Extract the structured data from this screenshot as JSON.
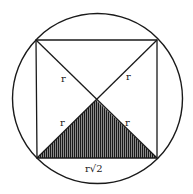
{
  "diagram": {
    "type": "geometry",
    "colors": {
      "stroke": "#1a1a1a",
      "shading": "#3a3a3a",
      "background": "#ffffff"
    },
    "circle": {
      "cx": 97.5,
      "cy": 98.5,
      "r": 85
    },
    "square": {
      "top_left": [
        36,
        40
      ],
      "top_right": [
        157,
        40
      ],
      "bottom_right": [
        157,
        158
      ],
      "bottom_left": [
        37,
        158
      ]
    },
    "center": [
      96,
      100
    ],
    "labels": {
      "upper_left_half_diagonal": "r",
      "upper_right_half_diagonal": "r",
      "lower_left_half_diagonal": "r",
      "lower_right_half_diagonal": "r",
      "bottom_side": "r√2"
    }
  }
}
